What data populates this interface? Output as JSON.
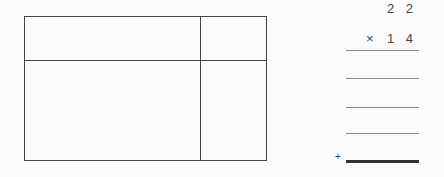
{
  "grid": {
    "cells": [
      {
        "position": "top-left",
        "value": ""
      },
      {
        "position": "top-right",
        "value": ""
      },
      {
        "position": "bottom-left",
        "value": ""
      },
      {
        "position": "bottom-right",
        "value": ""
      }
    ]
  },
  "multiplication": {
    "multiplicand": "2 2",
    "operator": "×",
    "multiplier": "1 4",
    "partial_products": [
      "",
      "",
      ""
    ],
    "sum_operator": "+",
    "result": ""
  }
}
